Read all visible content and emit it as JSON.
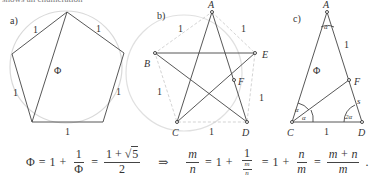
{
  "header": {
    "cutoff_text": "shows an enumeration"
  },
  "panels": {
    "a": {
      "label": "a)",
      "edge_labels": [
        "1",
        "1",
        "1",
        "1",
        "1"
      ],
      "diagonal_label": "Φ"
    },
    "b": {
      "label": "b)",
      "vertices": {
        "A": "A",
        "B": "B",
        "C": "C",
        "D": "D",
        "E": "E",
        "F": "F"
      },
      "edge_labels": [
        "1",
        "1",
        "1",
        "1"
      ]
    },
    "c": {
      "label": "c)",
      "vertices": {
        "A": "A",
        "C": "C",
        "D": "D",
        "F": "F"
      },
      "side_labels": {
        "AF": "1",
        "AC": "Φ",
        "FD": "s",
        "CD": "1"
      },
      "angles": {
        "A": "α",
        "C1": "α",
        "C2": "α",
        "D": "2α"
      }
    }
  },
  "formula": {
    "phi": "Φ",
    "eq": "=",
    "one": "1",
    "plus": "+",
    "sqrt5": "5",
    "two": "2",
    "implies": "⇒",
    "m": "m",
    "n": "n",
    "m_plus_n": "m + n",
    "period": "."
  },
  "colors": {
    "circle": "#d6d6d6",
    "lines": "#444444",
    "dashed": "#c8c8c8"
  }
}
